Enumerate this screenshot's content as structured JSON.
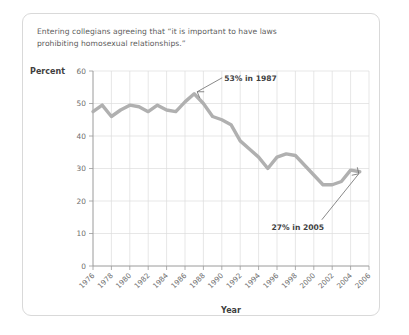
{
  "card": {
    "title_line1": "Entering collegians agreeing that “it is important to have laws",
    "title_line2": "prohibiting homosexual relationships.”"
  },
  "colors": {
    "line": "#b0b0b0",
    "grid": "#dcdcdc",
    "axis": "#9a9a9a",
    "text": "#5c5c5c",
    "card_border": "#d9d9d9",
    "background": "#ffffff"
  },
  "chart_data": {
    "type": "line",
    "title": "Entering collegians agreeing that “it is important to have laws prohibiting homosexual relationships.”",
    "xlabel": "Year",
    "ylabel": "Percent",
    "xlim": [
      1976,
      2006
    ],
    "ylim": [
      0,
      60
    ],
    "ytick_step": 10,
    "xtick_step": 2,
    "grid": true,
    "legend": "none",
    "yticks": [
      0,
      10,
      20,
      30,
      40,
      50,
      60
    ],
    "xticks": [
      1976,
      1978,
      1980,
      1982,
      1984,
      1986,
      1988,
      1990,
      1992,
      1994,
      1996,
      1998,
      2000,
      2002,
      2004,
      2006
    ],
    "x": [
      1976,
      1977,
      1978,
      1979,
      1980,
      1981,
      1982,
      1983,
      1984,
      1985,
      1986,
      1987,
      1988,
      1989,
      1990,
      1991,
      1992,
      1993,
      1994,
      1995,
      1996,
      1997,
      1998,
      1999,
      2000,
      2001,
      2002,
      2003,
      2004,
      2005
    ],
    "values": [
      47.5,
      49.5,
      46.0,
      48.0,
      49.5,
      49.0,
      47.5,
      49.5,
      48.0,
      47.5,
      50.5,
      53.0,
      50.0,
      46.0,
      45.0,
      43.5,
      38.5,
      36.0,
      33.5,
      30.0,
      33.5,
      34.5,
      34.0,
      31.0,
      28.0,
      25.0,
      25.0,
      26.0,
      29.5,
      29.0
    ],
    "annotations": [
      {
        "label": "53% in 1987",
        "x": 1987,
        "y": 53
      },
      {
        "label": "27% in 2005",
        "x": 2005,
        "y": 27
      }
    ]
  }
}
